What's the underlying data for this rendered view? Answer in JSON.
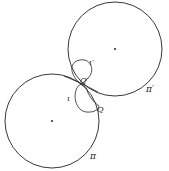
{
  "diagram": {
    "circles": [
      {
        "id": "pi-prime",
        "label": "π′",
        "cx": 115,
        "cy": 49,
        "r": 47
      },
      {
        "id": "pi",
        "label": "π",
        "cx": 52,
        "cy": 121,
        "r": 47
      }
    ],
    "points": [
      {
        "id": "Q-prime",
        "label": "Q′"
      },
      {
        "id": "Q",
        "label": "Q"
      }
    ],
    "loops": [
      {
        "id": "iota-prime",
        "label": "ι′"
      },
      {
        "id": "iota",
        "label": "ι"
      }
    ],
    "colors": {
      "stroke": "#222222",
      "background": "#ffffff"
    }
  }
}
